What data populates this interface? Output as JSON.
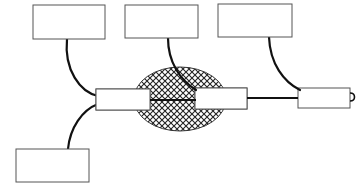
{
  "diagram": {
    "type": "network-topology",
    "nodes": [
      {
        "id": "node-top-left",
        "label": ""
      },
      {
        "id": "node-top-middle",
        "label": ""
      },
      {
        "id": "node-top-right",
        "label": ""
      },
      {
        "id": "node-bottom-left",
        "label": ""
      }
    ],
    "connectors": [
      {
        "id": "connector-left",
        "label": ""
      },
      {
        "id": "connector-middle",
        "label": ""
      },
      {
        "id": "connector-right",
        "label": ""
      }
    ],
    "links": [
      {
        "from": "node-top-left",
        "to": "connector-left"
      },
      {
        "from": "node-bottom-left",
        "to": "connector-left"
      },
      {
        "from": "node-top-middle",
        "to": "connector-middle"
      },
      {
        "from": "node-top-right",
        "to": "connector-right"
      },
      {
        "from": "connector-left",
        "to": "connector-middle"
      },
      {
        "from": "connector-middle",
        "to": "connector-right"
      }
    ],
    "region": {
      "id": "hatched-region",
      "fill": "crosshatch",
      "encloses": [
        "connector-left",
        "connector-middle"
      ]
    },
    "colors": {
      "stroke": "#111111",
      "box_border": "#555555",
      "hatch": "#333333",
      "background": "#ffffff"
    }
  }
}
